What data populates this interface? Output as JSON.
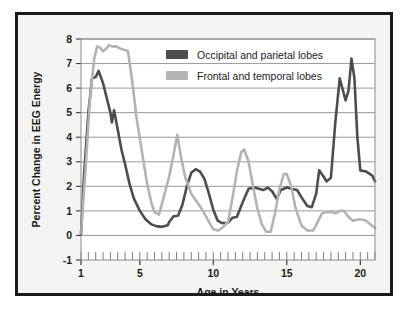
{
  "chart_data": {
    "type": "line",
    "title": "",
    "xlabel": "Age in Years",
    "ylabel": "Percent Change in EEG Energy",
    "xlim": [
      1,
      21
    ],
    "ylim": [
      -1,
      8
    ],
    "xticks": [
      1,
      5,
      10,
      15,
      20
    ],
    "xtick_labels": [
      "1",
      "5",
      "10",
      "15",
      "20"
    ],
    "yticks": [
      -1,
      0,
      1,
      2,
      3,
      4,
      5,
      6,
      7,
      8
    ],
    "ytick_labels": [
      "-1",
      "0",
      "1",
      "2",
      "3",
      "4",
      "5",
      "6",
      "7",
      "8"
    ],
    "minor_xtick_step": 0.5,
    "grid": "horizontal",
    "legend_position": "top-center-right",
    "series": [
      {
        "name": "Occipital and parietal lobes",
        "color": "#4d4d4d",
        "x": [
          1.0,
          1.2,
          1.5,
          1.75,
          2.0,
          2.2,
          2.5,
          2.75,
          3.0,
          3.1,
          3.25,
          3.5,
          3.75,
          4.0,
          4.3,
          4.6,
          5.0,
          5.4,
          5.8,
          6.1,
          6.5,
          6.9,
          7.0,
          7.3,
          7.6,
          7.9,
          8.2,
          8.5,
          8.8,
          9.1,
          9.4,
          9.7,
          10.0,
          10.3,
          10.6,
          11.0,
          11.3,
          11.6,
          12.0,
          12.4,
          12.8,
          13.1,
          13.4,
          13.7,
          14.0,
          14.3,
          14.6,
          15.0,
          15.3,
          15.7,
          16.0,
          16.4,
          16.7,
          17.0,
          17.2,
          17.5,
          17.7,
          18.0,
          18.3,
          18.6,
          19.0,
          19.2,
          19.4,
          19.6,
          19.8,
          20.0,
          20.4,
          20.8,
          21.0
        ],
        "y": [
          0.05,
          2.4,
          5.0,
          6.4,
          6.45,
          6.7,
          6.2,
          5.6,
          5.0,
          4.6,
          5.1,
          4.3,
          3.5,
          2.9,
          2.1,
          1.5,
          1.0,
          0.65,
          0.45,
          0.38,
          0.35,
          0.42,
          0.55,
          0.78,
          0.8,
          1.25,
          2.0,
          2.55,
          2.7,
          2.6,
          2.3,
          1.7,
          1.05,
          0.6,
          0.5,
          0.52,
          0.72,
          0.75,
          1.35,
          1.9,
          1.95,
          1.9,
          1.85,
          1.95,
          1.8,
          1.5,
          1.85,
          1.95,
          1.9,
          1.85,
          1.55,
          1.2,
          1.15,
          1.7,
          2.65,
          2.4,
          2.2,
          2.35,
          4.6,
          6.4,
          5.5,
          5.9,
          7.2,
          6.4,
          4.0,
          2.65,
          2.6,
          2.45,
          2.2
        ]
      },
      {
        "name": "Frontal and temporal lobes",
        "color": "#b3b3b3",
        "x": [
          1.0,
          1.3,
          1.6,
          1.9,
          2.1,
          2.3,
          2.5,
          2.7,
          2.9,
          3.1,
          3.4,
          3.7,
          4.0,
          4.2,
          4.5,
          4.8,
          5.2,
          5.5,
          5.8,
          6.0,
          6.3,
          6.6,
          7.0,
          7.3,
          7.55,
          7.8,
          8.1,
          8.5,
          8.9,
          9.3,
          9.7,
          10.0,
          10.3,
          10.6,
          11.0,
          11.3,
          11.6,
          11.9,
          12.1,
          12.4,
          12.7,
          13.0,
          13.3,
          13.6,
          13.9,
          14.2,
          14.5,
          14.8,
          15.0,
          15.3,
          15.6,
          16.0,
          16.4,
          16.8,
          17.1,
          17.4,
          17.7,
          18.0,
          18.3,
          18.6,
          18.9,
          19.2,
          19.5,
          19.8,
          20.1,
          20.4,
          20.7,
          21.0
        ],
        "y": [
          0.1,
          2.6,
          5.5,
          7.2,
          7.7,
          7.65,
          7.5,
          7.6,
          7.75,
          7.7,
          7.7,
          7.6,
          7.55,
          7.5,
          6.2,
          4.7,
          3.2,
          2.1,
          1.3,
          0.95,
          0.85,
          1.5,
          2.4,
          3.3,
          4.1,
          3.2,
          2.35,
          1.7,
          1.35,
          1.0,
          0.55,
          0.25,
          0.2,
          0.3,
          0.55,
          1.5,
          2.6,
          3.4,
          3.5,
          3.0,
          2.0,
          1.1,
          0.45,
          0.15,
          0.15,
          0.9,
          1.9,
          2.5,
          2.5,
          2.0,
          1.1,
          0.4,
          0.2,
          0.2,
          0.55,
          0.9,
          0.95,
          0.95,
          0.9,
          1.0,
          1.0,
          0.75,
          0.6,
          0.65,
          0.65,
          0.6,
          0.45,
          0.3
        ]
      }
    ]
  },
  "legend": {
    "entries": [
      {
        "label": "Occipital and parietal lobes",
        "color": "#4d4d4d"
      },
      {
        "label": "Frontal and temporal lobes",
        "color": "#b3b3b3"
      }
    ]
  },
  "axes": {
    "x_title": "Age in Years",
    "y_title": "Percent Change in EEG Energy"
  }
}
